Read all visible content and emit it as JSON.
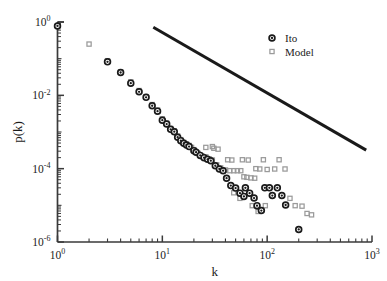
{
  "chart_data": {
    "type": "scatter",
    "title": "",
    "xlabel": "k",
    "ylabel": "p(k)",
    "xscale": "log",
    "yscale": "log",
    "xlim": [
      1,
      1000
    ],
    "ylim": [
      1e-06,
      1
    ],
    "xticks": [
      "10^0",
      "10^1",
      "10^2",
      "10^3"
    ],
    "yticks": [
      "10^0",
      "10^-2",
      "10^-4",
      "10^-6"
    ],
    "xtick_labels": [
      "10",
      "10",
      "10",
      "10"
    ],
    "xtick_exponents": [
      "0",
      "1",
      "2",
      "3"
    ],
    "ytick_labels": [
      "10",
      "10",
      "10",
      "10"
    ],
    "ytick_exponents": [
      "0",
      "-2",
      "-4",
      "-6"
    ],
    "grid": false,
    "legend_position": "top-right",
    "series": [
      {
        "name": "Ito",
        "marker": "circle-filled-ring",
        "color": "#1a1a1a",
        "points": [
          [
            1.0,
            0.78
          ],
          [
            3.0,
            0.082
          ],
          [
            4.0,
            0.042
          ],
          [
            5.0,
            0.0215
          ],
          [
            6.0,
            0.0125
          ],
          [
            7.0,
            0.0088
          ],
          [
            8.0,
            0.0052
          ],
          [
            9.0,
            0.0037
          ],
          [
            10.0,
            0.0021
          ],
          [
            11.0,
            0.00165
          ],
          [
            12.0,
            0.00118
          ],
          [
            13.0,
            0.00102
          ],
          [
            14.0,
            0.00072
          ],
          [
            15.0,
            0.00058
          ],
          [
            16.0,
            0.00049
          ],
          [
            17.0,
            0.00044
          ],
          [
            18.0,
            0.0004
          ],
          [
            20.0,
            0.00031
          ],
          [
            21.0,
            0.00028
          ],
          [
            23.0,
            0.00023
          ],
          [
            25.0,
            0.0002
          ],
          [
            27.0,
            0.00018
          ],
          [
            29.0,
            0.000165
          ],
          [
            32.0,
            0.00012
          ],
          [
            35.0,
            9.8e-05
          ],
          [
            38.0,
            8.8e-05
          ],
          [
            41.0,
            5.5e-05
          ],
          [
            45.0,
            3.45e-05
          ],
          [
            50.0,
            2.95e-05
          ],
          [
            55.0,
            2.15e-05
          ],
          [
            60.0,
            1.75e-05
          ],
          [
            62.0,
            3e-05
          ],
          [
            68.0,
            2.15e-05
          ],
          [
            75.0,
            1.58e-05
          ],
          [
            80.0,
            9.8e-06
          ],
          [
            88.0,
            7.2e-06
          ],
          [
            95.0,
            3e-05
          ],
          [
            105.0,
            3e-05
          ],
          [
            112.0,
            1.85e-05
          ],
          [
            125.0,
            3e-05
          ],
          [
            138.0,
            1.85e-05
          ],
          [
            150.0,
            1.02e-05
          ],
          [
            200.0,
            2.2e-06
          ]
        ]
      },
      {
        "name": "Model",
        "marker": "square-open",
        "color": "#9a9a9a",
        "points": [
          [
            2.0,
            0.25
          ],
          [
            3.0,
            0.088
          ],
          [
            4.0,
            0.044
          ],
          [
            5.0,
            0.0235
          ],
          [
            6.0,
            0.0135
          ],
          [
            7.0,
            0.0092
          ],
          [
            8.0,
            0.0056
          ],
          [
            9.0,
            0.004
          ],
          [
            10.0,
            0.0023
          ],
          [
            11.0,
            0.00175
          ],
          [
            12.0,
            0.00125
          ],
          [
            13.0,
            0.00108
          ],
          [
            14.0,
            0.00078
          ],
          [
            15.0,
            0.00062
          ],
          [
            16.0,
            0.00052
          ],
          [
            17.0,
            0.00047
          ],
          [
            18.0,
            0.00043
          ],
          [
            19.0,
            0.00038
          ],
          [
            20.0,
            0.00033
          ],
          [
            22.0,
            0.00026
          ],
          [
            24.0,
            0.00022
          ],
          [
            26.0,
            0.00021
          ],
          [
            28.0,
            0.000185
          ],
          [
            30.0,
            0.000172
          ],
          [
            33.0,
            0.000128
          ],
          [
            36.0,
            0.000105
          ],
          [
            40.0,
            9.2e-05
          ],
          [
            44.0,
            8.8e-05
          ],
          [
            48.0,
            8.8e-05
          ],
          [
            52.0,
            8.8e-05
          ],
          [
            56.0,
            8.8e-05
          ],
          [
            60.0,
            6e-05
          ],
          [
            64.0,
            5.8e-05
          ],
          [
            70.0,
            5.6e-05
          ],
          [
            76.0,
            5.5e-05
          ],
          [
            30.0,
            0.0004
          ],
          [
            34.0,
            0.00034
          ],
          [
            42.0,
            0.000175
          ],
          [
            46.0,
            0.000172
          ],
          [
            58.0,
            0.000175
          ],
          [
            66.0,
            0.000172
          ],
          [
            78.0,
            0.0001
          ],
          [
            85.0,
            9.8e-05
          ],
          [
            92.0,
            0.000175
          ],
          [
            100.0,
            9.5e-05
          ],
          [
            118.0,
            9.8e-05
          ],
          [
            130.0,
            0.000175
          ],
          [
            148.0,
            9.8e-05
          ],
          [
            165.0,
            1.55e-05
          ],
          [
            185.0,
            9.8e-06
          ],
          [
            215.0,
            9.5e-06
          ],
          [
            240.0,
            6e-06
          ],
          [
            265.0,
            5.5e-06
          ],
          [
            48.0,
            2.2e-05
          ],
          [
            55.0,
            1.55e-05
          ],
          [
            72.0,
            9.8e-06
          ],
          [
            82.0,
            6.8e-06
          ],
          [
            96.0,
            9.8e-06
          ],
          [
            26.0,
            0.00038
          ],
          [
            31.0,
            0.00036
          ]
        ]
      }
    ],
    "reference_line": {
      "name": "power-law-guide",
      "color": "#1a1a1a",
      "width": 3,
      "start": [
        8.2,
        0.72
      ],
      "end": [
        880.0,
        0.00032
      ]
    }
  },
  "legend": {
    "entries": [
      {
        "label": "Ito",
        "marker": "circle-filled-ring",
        "color": "#1a1a1a"
      },
      {
        "label": "Model",
        "marker": "square-open",
        "color": "#9a9a9a"
      }
    ]
  },
  "axes": {
    "x_title": "k",
    "y_title": "p(k)",
    "axis_color": "#3a3a3a"
  }
}
